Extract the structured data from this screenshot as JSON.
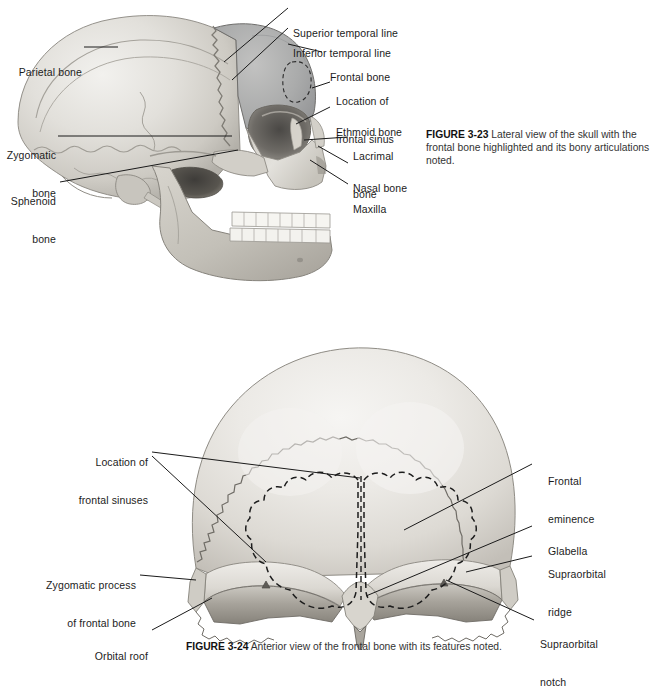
{
  "page": {
    "background_color": "#ffffff",
    "text_color": "#1c1c1c",
    "line_color": "#1a1a1a"
  },
  "figure_lateral_skull": {
    "id": "FIGURE 3-23",
    "view": "Lateral view of the skull",
    "caption_number": "FIGURE 3-23",
    "caption_text": "Lateral view of the skull with the frontal bone highlighted and its bony articulations noted.",
    "highlighted_bone": "frontal bone",
    "highlight_color": "#a9aaab",
    "bone_base_color": "#d7d5d0",
    "labels": [
      {
        "key": "parietal_bone",
        "text": "Parietal bone",
        "side": "left"
      },
      {
        "key": "zygomatic_bone",
        "text": "Zygomatic\nbone",
        "side": "left"
      },
      {
        "key": "sphenoid_bone",
        "text": "Sphenoid\nbone",
        "side": "left"
      },
      {
        "key": "superior_temporal_line",
        "text": "Superior temporal line",
        "side": "right"
      },
      {
        "key": "inferior_temporal_line",
        "text": "Inferior temporal line",
        "side": "right"
      },
      {
        "key": "frontal_bone",
        "text": "Frontal bone",
        "side": "right"
      },
      {
        "key": "location_frontal_sinus",
        "text": "Location of\nfrontal sinus",
        "side": "right"
      },
      {
        "key": "ethmoid_bone",
        "text": "Ethmoid bone",
        "side": "right"
      },
      {
        "key": "lacrimal_bone",
        "text": "Lacrimal\nbone",
        "side": "right"
      },
      {
        "key": "nasal_bone",
        "text": "Nasal bone",
        "side": "right"
      },
      {
        "key": "maxilla",
        "text": "Maxilla",
        "side": "right"
      }
    ],
    "label_lines": {
      "parietal_bone": "Parietal bone",
      "zygomatic_bone_1": "Zygomatic",
      "zygomatic_bone_2": "bone",
      "sphenoid_bone_1": "Sphenoid",
      "sphenoid_bone_2": "bone",
      "superior_temporal_line": "Superior temporal line",
      "inferior_temporal_line": "Inferior temporal line",
      "frontal_bone": "Frontal bone",
      "location_frontal_sinus_1": "Location of",
      "location_frontal_sinus_2": "frontal sinus",
      "ethmoid_bone": "Ethmoid bone",
      "lacrimal_bone_1": "Lacrimal",
      "lacrimal_bone_2": "bone",
      "nasal_bone": "Nasal bone",
      "maxilla": "Maxilla"
    }
  },
  "figure_frontal_bone": {
    "id": "FIGURE 3-24",
    "view": "Anterior view of the frontal bone",
    "caption_number": "FIGURE 3-24",
    "caption_text": "Anterior view of the frontal bone with its features noted.",
    "bone_base_color": "#dcdad6",
    "labels": [
      {
        "key": "location_frontal_sinuses",
        "text": "Location of\nfrontal sinuses",
        "side": "left"
      },
      {
        "key": "zygomatic_process",
        "text": "Zygomatic process\nof frontal bone",
        "side": "left"
      },
      {
        "key": "orbital_roof",
        "text": "Orbital roof",
        "side": "left"
      },
      {
        "key": "frontal_eminence",
        "text": "Frontal\neminence",
        "side": "right"
      },
      {
        "key": "glabella",
        "text": "Glabella",
        "side": "right"
      },
      {
        "key": "supraorbital_ridge",
        "text": "Supraorbital\nridge",
        "side": "right"
      },
      {
        "key": "supraorbital_notch",
        "text": "Supraorbital\nnotch",
        "side": "right"
      }
    ],
    "label_lines": {
      "location_frontal_sinuses_1": "Location of",
      "location_frontal_sinuses_2": "frontal sinuses",
      "zygomatic_process_1": "Zygomatic process",
      "zygomatic_process_2": "of frontal bone",
      "orbital_roof": "Orbital roof",
      "frontal_eminence_1": "Frontal",
      "frontal_eminence_2": "eminence",
      "glabella": "Glabella",
      "supraorbital_ridge_1": "Supraorbital",
      "supraorbital_ridge_2": "ridge",
      "supraorbital_notch_1": "Supraorbital",
      "supraorbital_notch_2": "notch"
    }
  }
}
